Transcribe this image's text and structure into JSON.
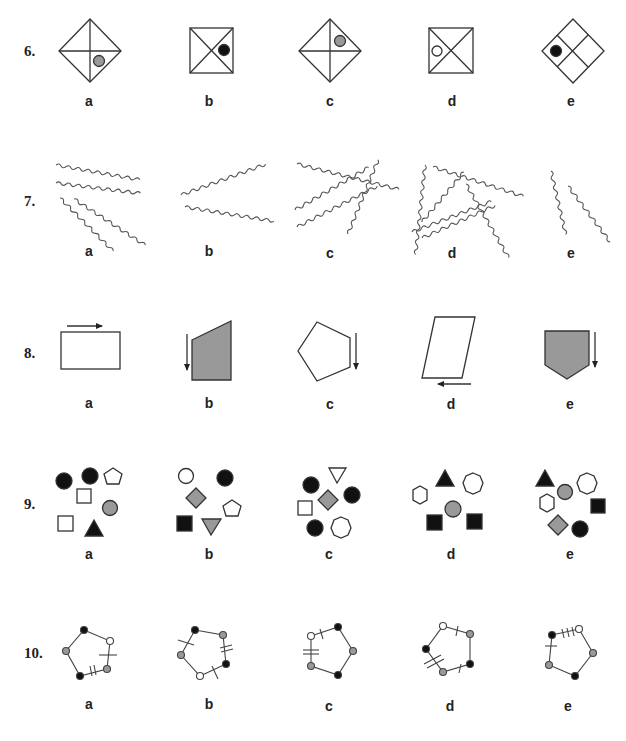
{
  "questions": [
    {
      "number": "6.",
      "options": [
        {
          "label": "a"
        },
        {
          "label": "b"
        },
        {
          "label": "c"
        },
        {
          "label": "d"
        },
        {
          "label": "e"
        }
      ]
    },
    {
      "number": "7.",
      "options": [
        {
          "label": "a"
        },
        {
          "label": "b"
        },
        {
          "label": "c"
        },
        {
          "label": "d"
        },
        {
          "label": "e"
        }
      ]
    },
    {
      "number": "8.",
      "options": [
        {
          "label": "a"
        },
        {
          "label": "b"
        },
        {
          "label": "c"
        },
        {
          "label": "d"
        },
        {
          "label": "e"
        }
      ]
    },
    {
      "number": "9.",
      "options": [
        {
          "label": "a"
        },
        {
          "label": "b"
        },
        {
          "label": "c"
        },
        {
          "label": "d"
        },
        {
          "label": "e"
        }
      ]
    },
    {
      "number": "10.",
      "options": [
        {
          "label": "a"
        },
        {
          "label": "b"
        },
        {
          "label": "c"
        },
        {
          "label": "d"
        },
        {
          "label": "e"
        }
      ]
    }
  ],
  "colors": {
    "line": "#333333",
    "gray_fill": "#999999",
    "black_fill": "#111111",
    "white_fill": "#ffffff"
  }
}
